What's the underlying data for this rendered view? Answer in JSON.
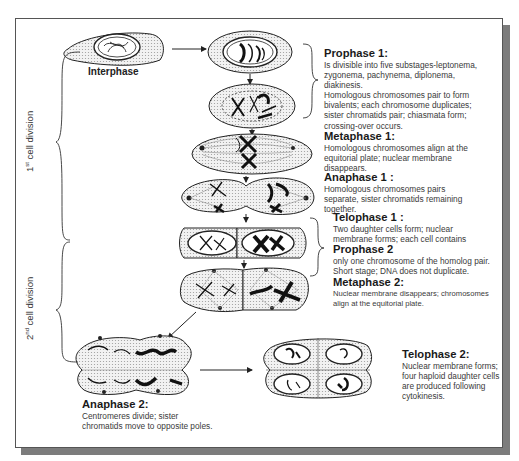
{
  "side_labels": {
    "first_division": {
      "ordinal": "1",
      "sup": "st",
      "text": " cell division"
    },
    "second_division": {
      "ordinal": "2",
      "sup": "nd",
      "text": " cell division"
    }
  },
  "cell_labels": {
    "interphase": "Interphase"
  },
  "stages": {
    "prophase1": {
      "title": "Prophase 1:",
      "lines": [
        "Is divisible into five substages-leptonema,",
        "zygonema, pachynema, diplonema,",
        "diakinesis.",
        "Homologous chromosomes pair to form",
        "bivalents; each chromosome duplicates;",
        "sister chromatids pair; chiasmata form;",
        "crossing-over occurs."
      ]
    },
    "metaphase1": {
      "title": "Metaphase 1:",
      "lines": [
        "Homologous chromosomes align at the",
        "equitorial plate; nuclear membrane",
        "disappears."
      ]
    },
    "anaphase1": {
      "title": "Anaphase 1 :",
      "lines": [
        "Homologous chromosomes pairs",
        "separate, sister chromatids remaining",
        "together."
      ]
    },
    "telophase1": {
      "title": "Telophase 1 :",
      "lines": [
        "Two daughter cells form; nuclear",
        "membrane forms; each cell contains"
      ]
    },
    "prophase2": {
      "title": "Prophase 2",
      "lines": [
        "only one chromosome of the homolog pair.",
        "Short stage; DNA does not  duplicate."
      ]
    },
    "metaphase2": {
      "title": "Metaphase 2:",
      "lines": [
        "Nuclear membrane disappears; chromosomes",
        "align at the equitorial plate."
      ]
    },
    "anaphase2": {
      "title": "Anaphase 2:",
      "lines": [
        "Centromeres divide; sister",
        "chromatids move to opposite poles."
      ]
    },
    "telophase2": {
      "title": "Telophase 2:",
      "lines": [
        "Nuclear membrane forms;",
        "four haploid daughter cells",
        "are produced following",
        "cytokinesis."
      ]
    }
  },
  "colors": {
    "frame_border": "#555555",
    "shadow": "#7c7c7c",
    "cell_fill": "#e6e6e6",
    "chromosome": "#111111",
    "text": "#3a3a3a"
  }
}
